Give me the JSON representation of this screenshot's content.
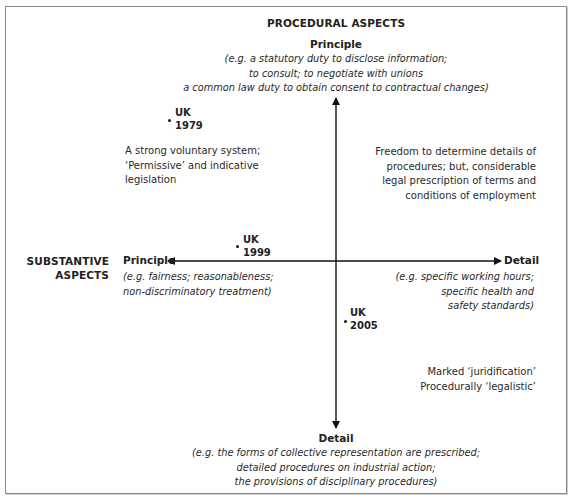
{
  "diagram": {
    "type": "quadrant-diagram",
    "vertical_axis": {
      "title": "PROCEDURAL ASPECTS",
      "top_label": "Principle",
      "top_examples": [
        "(e.g. a statutory duty to disclose information;",
        "to consult; to negotiate with unions",
        "a common law duty to obtain consent to contractual changes)"
      ],
      "bottom_label": "Detail",
      "bottom_examples": [
        "(e.g. the forms of collective representation are prescribed;",
        "detailed procedures on industrial action;",
        "the provisions of disciplinary procedures)"
      ]
    },
    "horizontal_axis": {
      "title_line1": "SUBSTANTIVE",
      "title_line2": "ASPECTS",
      "left_label": "Principle",
      "left_examples": [
        "(e.g. fairness; reasonableness;",
        "non-discriminatory treatment)"
      ],
      "right_label": "Detail",
      "right_examples": [
        "(e.g. specific working hours;",
        "specific health and",
        "safety standards)"
      ]
    },
    "quadrant_notes": {
      "top_left": [
        "A strong voluntary system;",
        "‘Permissive’ and indicative",
        "legislation"
      ],
      "top_right": [
        "Freedom to determine details of",
        "procedures; but, considerable",
        "legal prescription of terms and",
        "conditions of employment"
      ],
      "bottom_right": [
        "Marked ‘juridification’",
        "Procedurally ‘legalistic’"
      ]
    },
    "points": [
      {
        "line1": "UK",
        "line2": "1979"
      },
      {
        "line1": "UK",
        "line2": "1999"
      },
      {
        "line1": "UK",
        "line2": "2005"
      }
    ],
    "colors": {
      "axis": "#111111",
      "border": "#8a8a8a",
      "text": "#222222"
    }
  }
}
